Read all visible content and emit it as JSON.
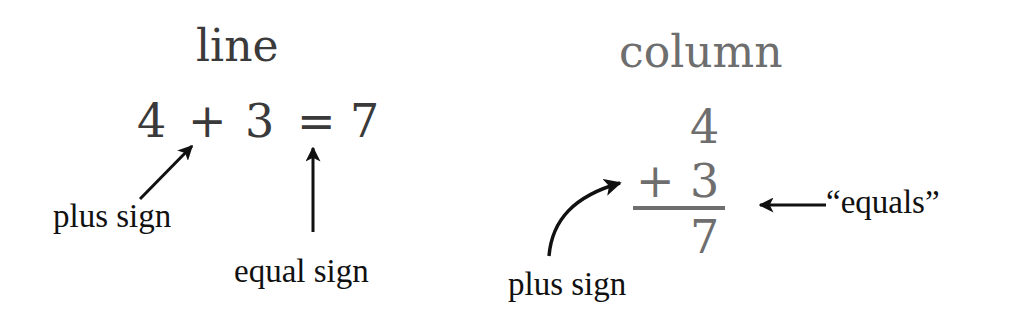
{
  "colors": {
    "line_text": "#3a3a3a",
    "column_text": "#6e6e6e",
    "labels": "#111111",
    "arrows": "#111111",
    "background": "#ffffff"
  },
  "line_panel": {
    "title": "line",
    "equation": {
      "addend1": "4",
      "plus": "+",
      "addend2": "3",
      "equals": "=",
      "sum": "7"
    },
    "labels": {
      "plus_sign": "plus sign",
      "equal_sign": "equal sign"
    }
  },
  "column_panel": {
    "title": "column",
    "equation": {
      "addend1": "4",
      "plus": "+",
      "addend2": "3",
      "sum": "7"
    },
    "labels": {
      "plus_sign": "plus sign",
      "equals": "“equals”"
    }
  }
}
